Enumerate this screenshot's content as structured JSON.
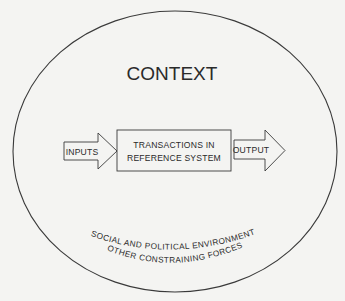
{
  "diagram": {
    "context_label": "CONTEXT",
    "process_box": {
      "line1": "TRANSACTIONS IN",
      "line2": "REFERENCE SYSTEM"
    },
    "input_arrow": {
      "label": "INPUTS"
    },
    "output_arrow": {
      "label": "OUTPUT"
    },
    "environment": {
      "line1": "SOCIAL AND POLITICAL ENVIRONMENT",
      "line2": "OTHER CONSTRAINING FORCES"
    },
    "colors": {
      "stroke": "#3a3a3a",
      "text": "#2a2a2a",
      "background": "#f4f4f2",
      "fill": "#f4f4f2"
    }
  }
}
